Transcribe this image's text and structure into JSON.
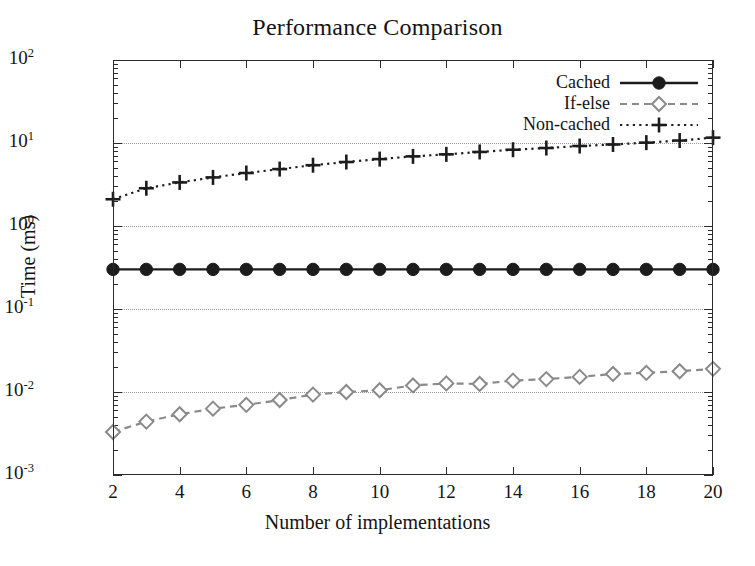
{
  "title": "Performance Comparison",
  "axes": {
    "xlabel": "Number of implementations",
    "ylabel": "Time (ms)",
    "xticks": [
      "2",
      "4",
      "6",
      "8",
      "10",
      "12",
      "14",
      "16",
      "18",
      "20"
    ],
    "yticks": [
      "10",
      "10",
      "10",
      "10",
      "10",
      "10"
    ],
    "yexps": [
      "2",
      "1",
      "0",
      "-1",
      "-2",
      "-3"
    ]
  },
  "legend": {
    "items": [
      {
        "label": "Cached",
        "marker": "filled-circle",
        "linestyle": "solid",
        "color": "#1c1c1c"
      },
      {
        "label": "If-else",
        "marker": "open-diamond",
        "linestyle": "dashed",
        "color": "#8a8a8a"
      },
      {
        "label": "Non-cached",
        "marker": "plus",
        "linestyle": "dotted",
        "color": "#1c1c1c"
      }
    ]
  },
  "chart_data": {
    "type": "line",
    "title": "Performance Comparison",
    "xlabel": "Number of implementations",
    "ylabel": "Time (ms)",
    "xscale": "linear",
    "yscale": "log",
    "xlim": [
      2,
      20
    ],
    "ylim": [
      0.001,
      100
    ],
    "grid": true,
    "legend_position": "top-right",
    "x": [
      2,
      3,
      4,
      5,
      6,
      7,
      8,
      9,
      10,
      11,
      12,
      13,
      14,
      15,
      16,
      17,
      18,
      19,
      20
    ],
    "series": [
      {
        "name": "Cached",
        "marker": "filled-circle",
        "linestyle": "solid",
        "color": "#1c1c1c",
        "values": [
          0.3,
          0.3,
          0.3,
          0.3,
          0.3,
          0.3,
          0.3,
          0.3,
          0.3,
          0.3,
          0.3,
          0.3,
          0.3,
          0.3,
          0.3,
          0.3,
          0.3,
          0.3,
          0.3
        ]
      },
      {
        "name": "If-else",
        "marker": "open-diamond",
        "linestyle": "dashed",
        "color": "#8a8a8a",
        "values": [
          0.0033,
          0.0044,
          0.0054,
          0.0063,
          0.007,
          0.008,
          0.0093,
          0.01,
          0.0105,
          0.012,
          0.0127,
          0.0125,
          0.0137,
          0.0143,
          0.0152,
          0.0165,
          0.017,
          0.0178,
          0.019
        ]
      },
      {
        "name": "Non-cached",
        "marker": "plus",
        "linestyle": "dotted",
        "color": "#1c1c1c",
        "values": [
          2.1,
          2.85,
          3.35,
          3.85,
          4.35,
          4.85,
          5.4,
          5.9,
          6.4,
          6.9,
          7.3,
          7.8,
          8.3,
          8.7,
          9.2,
          9.6,
          10.1,
          10.7,
          11.6
        ]
      }
    ]
  }
}
